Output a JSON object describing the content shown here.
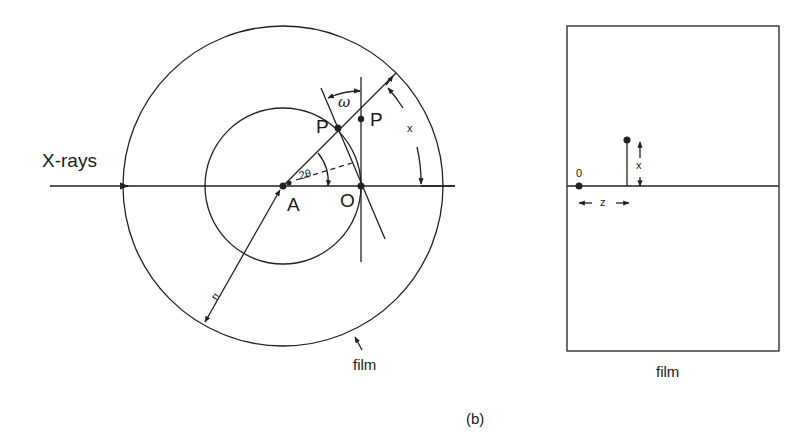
{
  "figure": {
    "caption": "(b)"
  },
  "left_diagram": {
    "beam_label": "X-rays",
    "point_A": "A",
    "point_O": "O",
    "point_P_sphere": "P",
    "point_P_proj": "P",
    "angle_omega": "ω",
    "angle_two_theta": "2θ",
    "arc_x": "x",
    "radius_rf": "r",
    "radius_rf_sub": "f",
    "film_label": "film"
  },
  "right_diagram": {
    "origin_label": "0",
    "height_label": "x",
    "distance_label": "z",
    "film_label": "film"
  },
  "colors": {
    "line": "#222222",
    "background": "#ffffff"
  }
}
